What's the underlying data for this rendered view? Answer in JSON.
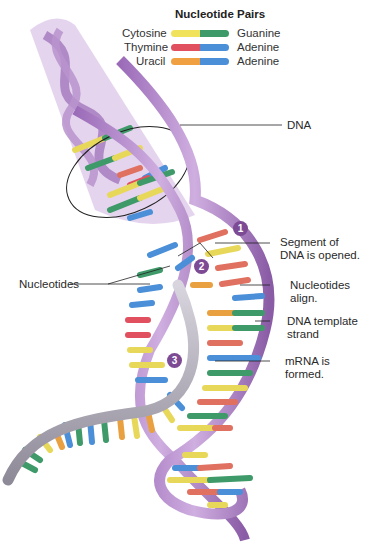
{
  "legend": {
    "title": "Nucleotide Pairs",
    "rows": [
      {
        "left": "Cytosine",
        "right": "Guanine",
        "left_color": "#f0e25a",
        "right_color": "#3f9a6a"
      },
      {
        "left": "Thymine",
        "right": "Adenine",
        "left_color": "#e0505e",
        "right_color": "#4a8fd8"
      },
      {
        "left": "Uracil",
        "right": "Adenine",
        "left_color": "#f0a040",
        "right_color": "#4a8fd8"
      }
    ]
  },
  "labels": {
    "dna": "DNA",
    "segment_1": "Segment of",
    "segment_2": "DNA is opened.",
    "nucleotides_left": "Nucleotides",
    "align_1": "Nucleotides",
    "align_2": "align.",
    "template_1": "DNA template",
    "template_2": "strand",
    "mrna_1": "mRNA is",
    "mrna_2": "formed."
  },
  "steps": [
    "1",
    "2",
    "3"
  ],
  "colors": {
    "backbone": "#b98ccc",
    "backbone_dark": "#8a5ca6",
    "mrna_backbone": "#a7a3b0",
    "step_badge": "#7d4a94",
    "cone": "#d9c2e6"
  }
}
